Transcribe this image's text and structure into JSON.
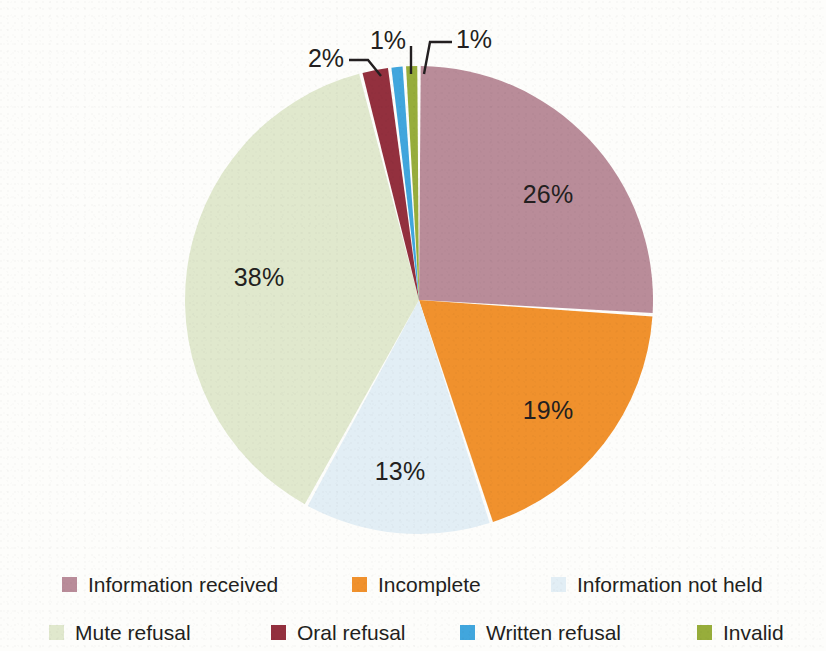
{
  "chart_data": {
    "type": "pie",
    "title": "",
    "subtitle": "",
    "xlabel": "",
    "ylabel": "",
    "legend_position": "bottom",
    "grid": false,
    "units": "percent",
    "start_angle_deg": 0,
    "direction": "clockwise",
    "categories": [
      "Information received",
      "Incomplete",
      "Information not held",
      "Mute refusal",
      "Oral refusal",
      "Written refusal",
      "Invalid"
    ],
    "values": [
      26,
      19,
      13,
      38,
      2,
      1,
      1
    ],
    "data_labels": [
      "26%",
      "19%",
      "13%",
      "38%",
      "2%",
      "1%",
      "1%"
    ],
    "colors": [
      "#b98c99",
      "#f0912d",
      "#e2eef5",
      "#e0e8cd",
      "#93303e",
      "#41a6dd",
      "#97ad3b"
    ],
    "slices": [
      {
        "label": "Information received",
        "value": 26,
        "data_label": "26%",
        "color": "#b98c99",
        "label_placement": "inside"
      },
      {
        "label": "Incomplete",
        "value": 19,
        "data_label": "19%",
        "color": "#f0912d",
        "label_placement": "inside"
      },
      {
        "label": "Information not held",
        "value": 13,
        "data_label": "13%",
        "color": "#e2eef5",
        "label_placement": "inside"
      },
      {
        "label": "Mute refusal",
        "value": 38,
        "data_label": "38%",
        "color": "#e0e8cd",
        "label_placement": "inside"
      },
      {
        "label": "Oral refusal",
        "value": 2,
        "data_label": "2%",
        "color": "#93303e",
        "label_placement": "callout"
      },
      {
        "label": "Written refusal",
        "value": 1,
        "data_label": "1%",
        "color": "#41a6dd",
        "label_placement": "callout"
      },
      {
        "label": "Invalid",
        "value": 1,
        "data_label": "1%",
        "color": "#97ad3b",
        "label_placement": "callout"
      }
    ]
  },
  "labels": {
    "information_received": "26%",
    "incomplete": "19%",
    "information_not_held": "13%",
    "mute_refusal": "38%",
    "oral_refusal": "2%",
    "written_refusal": "1%",
    "invalid": "1%"
  },
  "legend": {
    "rows": [
      [
        {
          "label": "Information received",
          "color": "#b98c99"
        },
        {
          "label": "Incomplete",
          "color": "#f0912d"
        },
        {
          "label": "Information not held",
          "color": "#e2eef5"
        }
      ],
      [
        {
          "label": "Mute refusal",
          "color": "#e0e8cd"
        },
        {
          "label": "Oral refusal",
          "color": "#93303e"
        },
        {
          "label": "Written refusal",
          "color": "#41a6dd"
        },
        {
          "label": "Invalid",
          "color": "#97ad3b"
        }
      ]
    ]
  },
  "colors": {
    "background": "#fdfdfb",
    "text": "#231f20",
    "slice_separator": "#ffffff",
    "leader_line": "#231f20"
  }
}
